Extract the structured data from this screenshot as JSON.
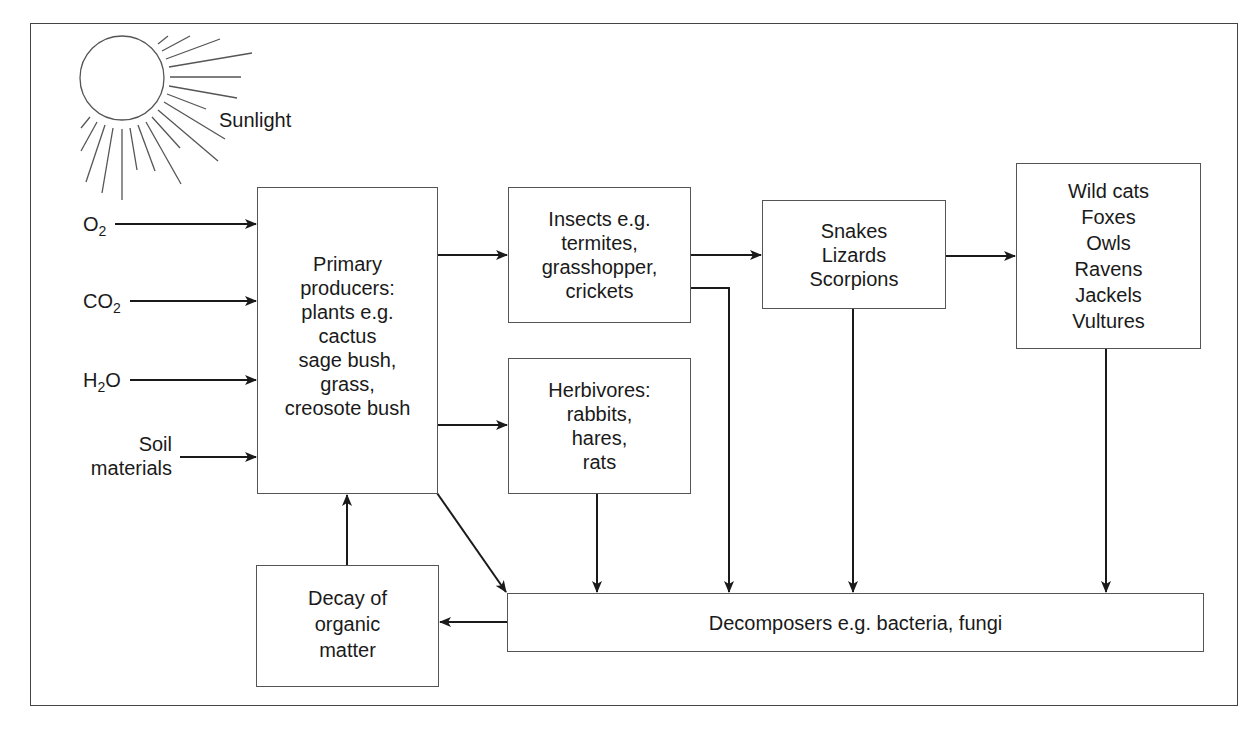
{
  "diagram": {
    "type": "desert-ecosystem-food-web",
    "sun": {
      "label": "Sunlight"
    },
    "inputs": [
      {
        "id": "o2",
        "base": "O",
        "sub": "2",
        "suffix": ""
      },
      {
        "id": "co2",
        "base": "CO",
        "sub": "2",
        "suffix": ""
      },
      {
        "id": "h2o",
        "base": "H",
        "sub": "2",
        "suffix": "O"
      },
      {
        "id": "soil",
        "lines": [
          "Soil",
          "materials"
        ]
      }
    ],
    "nodes": {
      "producers": {
        "lines": [
          "Primary",
          "producers:",
          "plants e.g.",
          "cactus",
          "sage bush,",
          "grass,",
          "creosote bush"
        ]
      },
      "insects": {
        "lines": [
          "Insects e.g.",
          "termites,",
          "grasshopper,",
          "crickets"
        ]
      },
      "herbivores": {
        "lines": [
          "Herbivores:",
          "rabbits,",
          "hares,",
          "rats"
        ]
      },
      "reptiles": {
        "lines": [
          "Snakes",
          "Lizards",
          "Scorpions"
        ]
      },
      "predators": {
        "lines": [
          "Wild cats",
          "Foxes",
          "Owls",
          "Ravens",
          "Jackels",
          "Vultures"
        ]
      },
      "decomposers": {
        "lines": [
          "Decomposers e.g. bacteria, fungi"
        ]
      },
      "decay": {
        "lines": [
          "Decay of",
          "organic",
          "matter"
        ]
      }
    },
    "edges": [
      {
        "from": "o2",
        "to": "producers"
      },
      {
        "from": "co2",
        "to": "producers"
      },
      {
        "from": "h2o",
        "to": "producers"
      },
      {
        "from": "soil",
        "to": "producers"
      },
      {
        "from": "producers",
        "to": "insects"
      },
      {
        "from": "producers",
        "to": "herbivores"
      },
      {
        "from": "producers",
        "to": "decomposers"
      },
      {
        "from": "insects",
        "to": "reptiles"
      },
      {
        "from": "insects",
        "to": "decomposers"
      },
      {
        "from": "herbivores",
        "to": "decomposers"
      },
      {
        "from": "reptiles",
        "to": "predators"
      },
      {
        "from": "reptiles",
        "to": "decomposers"
      },
      {
        "from": "predators",
        "to": "decomposers"
      },
      {
        "from": "decomposers",
        "to": "decay"
      },
      {
        "from": "decay",
        "to": "producers"
      }
    ],
    "colors": {
      "line": "#1a1a1a",
      "border": "#555555",
      "background": "#ffffff"
    }
  }
}
